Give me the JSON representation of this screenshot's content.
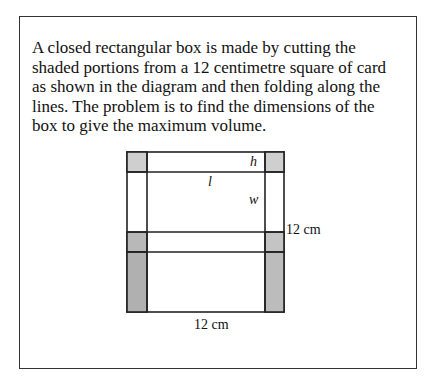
{
  "problem": {
    "text": "A closed rectangular box is made by cutting the shaded portions from a 12 centimetre square of card as shown in the diagram and then folding along the lines. The problem is to find the dimensions of the box to give the maximum volume."
  },
  "diagram": {
    "labels": {
      "h": "h",
      "l": "l",
      "w": "w",
      "side_right": "12 cm",
      "side_bottom": "12 cm"
    },
    "colors": {
      "line": "#222222",
      "shade": "#b8b8b8",
      "shade_light": "#cfcfcf",
      "card": "#ffffff"
    }
  }
}
